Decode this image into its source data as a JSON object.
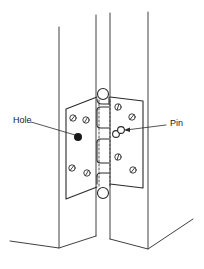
{
  "diagram": {
    "labels": {
      "hole": "Hole",
      "pin": "Pin"
    },
    "colors": {
      "line": "#2a2a2a",
      "background": "#ffffff",
      "hole_fill": "#1a1a1a"
    }
  }
}
